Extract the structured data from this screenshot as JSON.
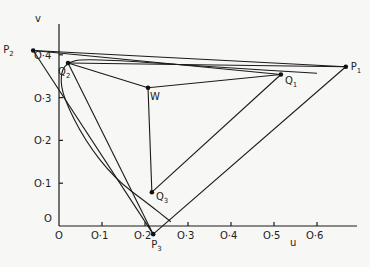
{
  "chart_data": {
    "type": "diagram",
    "xlabel": "u",
    "ylabel": "v",
    "origin_label": "O",
    "xticks": [
      {
        "value": 0.0,
        "label": "O"
      },
      {
        "value": 0.1,
        "label": "O·1"
      },
      {
        "value": 0.2,
        "label": "O·2"
      },
      {
        "value": 0.3,
        "label": "O·3"
      },
      {
        "value": 0.4,
        "label": "O·4"
      },
      {
        "value": 0.5,
        "label": "O·5"
      },
      {
        "value": 0.6,
        "label": "O·6"
      }
    ],
    "yticks": [
      {
        "value": 0.1,
        "label": "O·1"
      },
      {
        "value": 0.2,
        "label": "O·2"
      },
      {
        "value": 0.3,
        "label": "O·3"
      },
      {
        "value": 0.4,
        "label": "O·4"
      }
    ],
    "xlim": [
      0,
      0.68
    ],
    "ylim": [
      0,
      0.42
    ],
    "points": [
      {
        "id": "P1",
        "label": "P",
        "sub": "1",
        "u": 0.667,
        "v": 0.372
      },
      {
        "id": "P2",
        "label": "P",
        "sub": "2",
        "u": -0.06,
        "v": 0.41
      },
      {
        "id": "P3",
        "label": "P",
        "sub": "3",
        "u": 0.219,
        "v": -0.019
      },
      {
        "id": "Q1",
        "label": "Q",
        "sub": "1",
        "u": 0.516,
        "v": 0.354
      },
      {
        "id": "Q2",
        "label": "Q",
        "sub": "2",
        "u": 0.021,
        "v": 0.381
      },
      {
        "id": "Q3",
        "label": "Q",
        "sub": "3",
        "u": 0.216,
        "v": 0.079
      },
      {
        "id": "W",
        "label": "W",
        "sub": "",
        "u": 0.207,
        "v": 0.323
      }
    ],
    "segments": [
      [
        "P1",
        "P2"
      ],
      [
        "P2",
        "P3"
      ],
      [
        "P1",
        "P3"
      ],
      [
        "P2",
        "Q1"
      ],
      [
        "Q2",
        "P1"
      ],
      [
        "Q2",
        "W"
      ],
      [
        "W",
        "Q1"
      ],
      [
        "W",
        "Q3"
      ],
      [
        "Q2",
        "P3"
      ],
      [
        "Q1",
        "Q3"
      ]
    ],
    "curve_label": "locus curve through Q2"
  }
}
